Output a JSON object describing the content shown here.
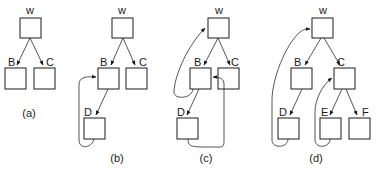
{
  "diagram": {
    "type": "tree-with-thread-links",
    "colors": {
      "stroke": "#1a1a1a",
      "background": "#ffffff"
    },
    "panels": [
      {
        "id": "a",
        "caption": "(a)",
        "nodes": [
          {
            "id": "W",
            "label": "w"
          },
          {
            "id": "B",
            "label": "B"
          },
          {
            "id": "C",
            "label": "C"
          }
        ],
        "edges": [
          {
            "from": "W",
            "to": "B",
            "kind": "child"
          },
          {
            "from": "W",
            "to": "C",
            "kind": "child"
          }
        ]
      },
      {
        "id": "b",
        "caption": "(b)",
        "nodes": [
          {
            "id": "W",
            "label": "w"
          },
          {
            "id": "B",
            "label": "B"
          },
          {
            "id": "C",
            "label": "C"
          },
          {
            "id": "D",
            "label": "D"
          }
        ],
        "edges": [
          {
            "from": "W",
            "to": "B",
            "kind": "child"
          },
          {
            "from": "W",
            "to": "C",
            "kind": "child"
          },
          {
            "from": "B",
            "to": "D",
            "kind": "child"
          },
          {
            "from": "D",
            "to": "B",
            "kind": "thread"
          }
        ]
      },
      {
        "id": "c",
        "caption": "(c)",
        "nodes": [
          {
            "id": "W",
            "label": "w"
          },
          {
            "id": "B",
            "label": "B"
          },
          {
            "id": "C",
            "label": "C"
          },
          {
            "id": "D",
            "label": "D"
          }
        ],
        "edges": [
          {
            "from": "W",
            "to": "B",
            "kind": "child"
          },
          {
            "from": "W",
            "to": "C",
            "kind": "child"
          },
          {
            "from": "B",
            "to": "D",
            "kind": "child"
          },
          {
            "from": "B",
            "to": "W",
            "kind": "thread"
          },
          {
            "from": "D",
            "to": "B",
            "kind": "thread"
          }
        ]
      },
      {
        "id": "d",
        "caption": "(d)",
        "nodes": [
          {
            "id": "W",
            "label": "w"
          },
          {
            "id": "B",
            "label": "B"
          },
          {
            "id": "C",
            "label": "C"
          },
          {
            "id": "D",
            "label": "D"
          },
          {
            "id": "E",
            "label": "E"
          },
          {
            "id": "F",
            "label": "F"
          }
        ],
        "edges": [
          {
            "from": "W",
            "to": "B",
            "kind": "child"
          },
          {
            "from": "W",
            "to": "C",
            "kind": "child"
          },
          {
            "from": "B",
            "to": "D",
            "kind": "child"
          },
          {
            "from": "C",
            "to": "E",
            "kind": "child"
          },
          {
            "from": "C",
            "to": "F",
            "kind": "child"
          },
          {
            "from": "D",
            "to": "W",
            "kind": "thread"
          },
          {
            "from": "E",
            "to": "C",
            "kind": "thread"
          }
        ]
      }
    ]
  }
}
